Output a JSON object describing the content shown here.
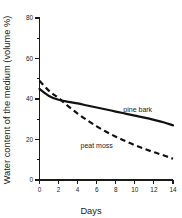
{
  "chart_data": {
    "type": "line",
    "title": "",
    "xlabel": "Days",
    "ylabel": "Water content of the medium (volume %)",
    "xlim": [
      0,
      14
    ],
    "ylim": [
      0,
      80
    ],
    "xticks": [
      0,
      2,
      4,
      6,
      8,
      10,
      12,
      14
    ],
    "yticks": [
      0,
      20,
      40,
      60,
      80
    ],
    "xtick_labels": [
      "0",
      "2",
      "4",
      "6",
      "8",
      "10",
      "12",
      "14"
    ],
    "ytick_labels": [
      "0",
      "20",
      "40",
      "60",
      "80"
    ],
    "x_minor_ticks": [
      1,
      3,
      5,
      7,
      9,
      11,
      13
    ],
    "y_minor_ticks": [
      10,
      30,
      50,
      70
    ],
    "grid": false,
    "legend_position": "inline-annotation",
    "x": [
      0,
      1,
      2,
      3,
      4,
      5,
      6,
      7,
      8,
      9,
      10,
      11,
      12,
      13,
      14
    ],
    "series": [
      {
        "name": "pine bark",
        "style": "solid",
        "color": "#111111",
        "values": [
          45.0,
          41.5,
          39.6,
          38.6,
          37.8,
          36.8,
          35.8,
          34.8,
          33.8,
          32.8,
          31.8,
          30.8,
          29.7,
          28.5,
          27.0
        ],
        "label_x": 10.3,
        "label_y": 33.6
      },
      {
        "name": "peat moss",
        "style": "dashed",
        "color": "#111111",
        "values": [
          49.0,
          44.0,
          40.5,
          36.5,
          32.8,
          29.5,
          26.5,
          23.8,
          21.4,
          19.2,
          17.2,
          15.4,
          13.7,
          12.2,
          10.5
        ],
        "label_x": 6.0,
        "label_y": 16.0
      }
    ],
    "annotations": [
      {
        "text": "pine bark",
        "series": "pine bark"
      },
      {
        "text": "peat moss",
        "series": "peat moss"
      }
    ]
  },
  "figure": {
    "background": "#ffffff",
    "axis_color": "#1a1a1a",
    "ink_color": "#111111"
  }
}
